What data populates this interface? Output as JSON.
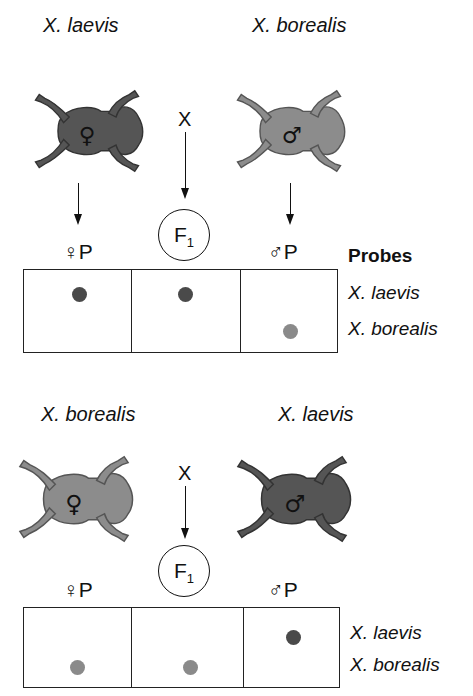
{
  "colors": {
    "laevis": "#555555",
    "borealis": "#8c8c8c",
    "dot_laevis": "#4a4a4a",
    "dot_borealis": "#8a8a8a"
  },
  "panels": [
    {
      "female_species": "X. laevis",
      "male_species": "X. borealis",
      "female_symbol": "♀",
      "male_symbol": "♂",
      "cross_symbol": "X",
      "offspring": {
        "main": "F",
        "sub": "1"
      },
      "columns": [
        {
          "label": "♀P",
          "dots": [
            "X. laevis"
          ]
        },
        {
          "label": "",
          "dots": [
            "X. laevis"
          ]
        },
        {
          "label": "♂P",
          "dots": [
            "X. borealis"
          ]
        }
      ],
      "probes_title": "Probes",
      "probe_labels": [
        "X. laevis",
        "X. borealis"
      ]
    },
    {
      "female_species": "X. borealis",
      "male_species": "X. laevis",
      "female_symbol": "♀",
      "male_symbol": "♂",
      "cross_symbol": "X",
      "offspring": {
        "main": "F",
        "sub": "1"
      },
      "columns": [
        {
          "label": "♀P",
          "dots": [
            "X. borealis"
          ]
        },
        {
          "label": "",
          "dots": [
            "X. borealis"
          ]
        },
        {
          "label": "♂P",
          "dots": [
            "X. laevis"
          ]
        }
      ],
      "probe_labels": [
        "X. laevis",
        "X. borealis"
      ]
    }
  ]
}
